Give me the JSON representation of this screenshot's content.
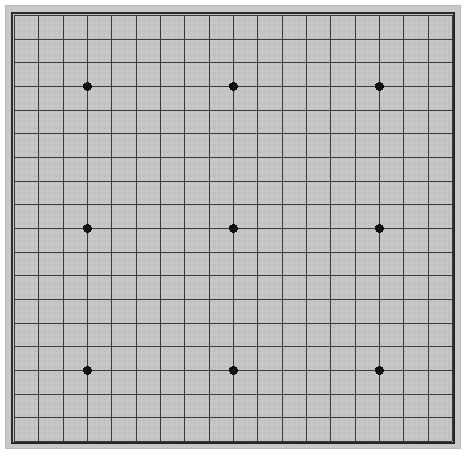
{
  "app": {
    "title": "Go Board",
    "board_type": "goban"
  },
  "board": {
    "name": "Go board (goban)",
    "size": 19,
    "columns": 19,
    "rows": 19,
    "intersections": 361,
    "colors": {
      "surface": "#c8c8c8",
      "grid_line": "#3a3a3a",
      "frame_line": "#2d2d2d",
      "star_point": "#0f0f0f",
      "page_background": "#ffffff",
      "bezel": "#c9c9c9"
    },
    "geometry": {
      "grid_left": 14,
      "grid_top": 15,
      "grid_right": 452,
      "grid_bottom": 441,
      "cell_width": 24.33,
      "cell_height": 23.67,
      "grid_line_width": 1,
      "frame_line_width": 2,
      "star_point_radius": 4.5
    },
    "star_points": {
      "count": 9,
      "label": "hoshi",
      "grid_indices": [
        [
          3,
          3
        ],
        [
          9,
          3
        ],
        [
          15,
          3
        ],
        [
          3,
          9
        ],
        [
          9,
          9
        ],
        [
          15,
          9
        ],
        [
          3,
          15
        ],
        [
          9,
          15
        ],
        [
          15,
          15
        ]
      ],
      "pixel_positions": [
        [
          87,
          86
        ],
        [
          234,
          86
        ],
        [
          383,
          86
        ],
        [
          87,
          228
        ],
        [
          234,
          228
        ],
        [
          383,
          228
        ],
        [
          87,
          371
        ],
        [
          234,
          371
        ],
        [
          383,
          371
        ]
      ]
    },
    "stones": []
  }
}
